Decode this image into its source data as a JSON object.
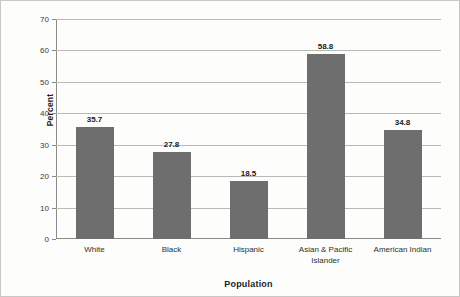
{
  "chart_data": {
    "type": "bar",
    "title": "",
    "xlabel": "Population",
    "ylabel": "Percent",
    "categories": [
      "White",
      "Black",
      "Hispanic",
      "Asian & Pacific Islander",
      "American Indian"
    ],
    "values": [
      35.7,
      27.8,
      18.5,
      58.8,
      34.8
    ],
    "value_labels": [
      "35.7",
      "27.8",
      "18.5",
      "58.8",
      "34.8"
    ],
    "ylim": [
      0,
      70
    ],
    "ytick_labels": [
      "0",
      "10",
      "20",
      "30",
      "40",
      "50",
      "60",
      "70"
    ],
    "ytick_values": [
      0,
      10,
      20,
      30,
      40,
      50,
      60,
      70
    ],
    "grid": true,
    "legend": false,
    "legend_position": "none",
    "bar_color": "#6e6e6e",
    "axis_color": "#8a8a86",
    "gridline_color": "#b9b9b5",
    "background_color": "#fdfdfc"
  }
}
